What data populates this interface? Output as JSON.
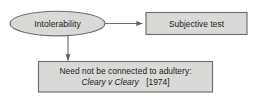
{
  "diagram": {
    "background_color": "#ffffff",
    "node_fill": "#d9d9d7",
    "node_stroke": "#7a7a78",
    "connector_color": "#6e6e6c",
    "text_color": "#1c1c1c",
    "nodes": {
      "root": {
        "shape": "ellipse",
        "label": "Intolerability"
      },
      "subjective_test": {
        "shape": "rectangle",
        "label": "Subjective test"
      },
      "adultery_note": {
        "shape": "rectangle",
        "line1": "Need not be connected to adultery:",
        "case_name": "Cleary v Cleary",
        "case_year": "[1974]"
      }
    },
    "connectors": [
      {
        "name": "root-to-subjective-test",
        "from": "root",
        "to": "subjective_test",
        "direction": "right",
        "arrowhead": "filled-triangle"
      },
      {
        "name": "root-to-adultery-note",
        "from": "root",
        "to": "adultery_note",
        "direction": "down",
        "arrowhead": "filled-triangle"
      }
    ]
  }
}
